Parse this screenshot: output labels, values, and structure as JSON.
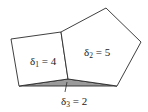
{
  "diagram": {
    "type": "planar-subdivision",
    "faces": [
      {
        "id": "face-1",
        "shape": "quadrilateral",
        "fill": "#ffffff",
        "vertices": [
          [
            11,
            39
          ],
          [
            61,
            32
          ],
          [
            68,
            79
          ],
          [
            19,
            86
          ]
        ],
        "label": {
          "symbol": "δ",
          "subscript": "1",
          "equals": " = ",
          "value": "4",
          "x": 30,
          "y": 65
        }
      },
      {
        "id": "face-2",
        "shape": "pentagon",
        "fill": "#ffffff",
        "vertices": [
          [
            61,
            32
          ],
          [
            106,
            8
          ],
          [
            141,
            42
          ],
          [
            117,
            86
          ],
          [
            68,
            79
          ]
        ],
        "label": {
          "symbol": "δ",
          "subscript": "2",
          "equals": " = ",
          "value": "5",
          "x": 84,
          "y": 56
        }
      },
      {
        "id": "face-3",
        "shape": "triangle",
        "fill": "#9a9a9a",
        "vertices": [
          [
            19,
            86
          ],
          [
            68,
            79
          ],
          [
            117,
            86
          ]
        ],
        "label": {
          "symbol": "δ",
          "subscript": "3",
          "equals": " = ",
          "value": "2",
          "x": 61,
          "y": 105
        },
        "pointer": {
          "from": [
            67,
            82
          ],
          "to": [
            65,
            92
          ]
        }
      }
    ]
  }
}
